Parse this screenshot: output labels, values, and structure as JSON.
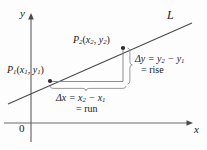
{
  "figure": {
    "background_color": "#fdfdfd",
    "stroke_color": "#555555",
    "text_color": "#1a1a1a"
  },
  "axes": {
    "y_label": "y",
    "x_label": "x",
    "origin_label": "0"
  },
  "line": {
    "label": "L"
  },
  "points": {
    "p1": {
      "name": "P",
      "sub": "1",
      "coords_x": "x",
      "coords_x_sub": "1",
      "coords_y": "y",
      "coords_y_sub": "1"
    },
    "p2": {
      "name": "P",
      "sub": "2",
      "coords_x": "x",
      "coords_x_sub": "2",
      "coords_y": "y",
      "coords_y_sub": "2"
    }
  },
  "annotations": {
    "delta_y_line1_pre": "Δy = y",
    "delta_y_line1_sub1": "2",
    "delta_y_line1_mid": " − y",
    "delta_y_line1_sub2": "1",
    "delta_y_line2": "= rise",
    "delta_x_line1_pre": "Δx = x",
    "delta_x_line1_sub1": "2",
    "delta_x_line1_mid": " − x",
    "delta_x_line1_sub2": "1",
    "delta_x_line2": "= run"
  },
  "geometry": {
    "p1_px": [
      50,
      81
    ],
    "p2_px": [
      123,
      48
    ],
    "line_start_px": [
      8,
      104
    ],
    "line_end_px": [
      192,
      23
    ],
    "x_axis_y_px": 123,
    "y_axis_x_px": 31
  }
}
